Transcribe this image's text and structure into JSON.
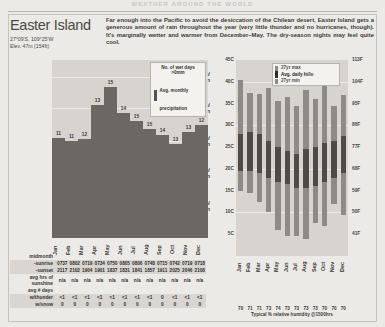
{
  "running_head": "WEATHER AROUND THE WORLD",
  "location": {
    "name": "Easter Island",
    "coordinates": "27°09'S, 109°25'W",
    "elevation": "Elev. 47m (154ft)",
    "description": "Far enough into the Pacific to avoid the desiccation of the Chilean desert, Easter Island gets a generous amount of rain throughout the year (very little thunder and no hurricanes, though). It's marginally wetter and warmer from December–May. The dry-season nights may feel quite cool."
  },
  "months": [
    "Jan",
    "Feb",
    "Mar",
    "Apr",
    "May",
    "Jun",
    "Jul",
    "Aug",
    "Sep",
    "Oct",
    "Nov",
    "Dec"
  ],
  "chart_data": [
    {
      "type": "bar",
      "title": "Avg. monthly precipitation",
      "categories": [
        "Jan",
        "Feb",
        "Mar",
        "Apr",
        "May",
        "Jun",
        "Jul",
        "Aug",
        "Sep",
        "Oct",
        "Nov",
        "Dec"
      ],
      "values": [
        79,
        76,
        78,
        105,
        119,
        98,
        92,
        86,
        81,
        74,
        83,
        89
      ],
      "data_labels": [
        11,
        11,
        12,
        13,
        15,
        14,
        15,
        15,
        14,
        13,
        13,
        12
      ],
      "ylabel": "precipitation",
      "ylim": [
        0,
        140
      ],
      "yticks_mm": [
        25,
        51,
        76,
        102,
        127
      ],
      "ytick_labels": [
        "25mm/\n1in",
        "51mm/\n2in",
        "76mm/\n3in",
        "102mm/\n4in",
        "127mm/\n5in"
      ],
      "ytick_labels_flat": [
        "127mm/ 5in",
        "102mm/ 4in",
        "76mm/ 3in",
        "51mm/ 2in",
        "25mm/ 1in"
      ],
      "legend": {
        "title": "No. of wet days >0mm",
        "title_line1": "No. of wet days",
        "title_line2": ">0mm",
        "swatch_label": "Avg. monthly precipitation",
        "swatch_line1": "Avg. monthly",
        "swatch_line2": "precipitation",
        "swatch_color": "#56534f"
      },
      "grid": true,
      "bar_color": "#6b6863"
    },
    {
      "type": "bar",
      "title": "Temperature range",
      "categories": [
        "Jan",
        "Feb",
        "Mar",
        "Apr",
        "May",
        "Jun",
        "Jul",
        "Aug",
        "Sep",
        "Oct",
        "Nov",
        "Dec"
      ],
      "series": [
        {
          "name": "27yr max",
          "values": [
            40.5,
            37.5,
            37.3,
            38.5,
            35.5,
            36.5,
            34.5,
            38.0,
            36.0,
            39.5,
            34.5,
            37.0
          ]
        },
        {
          "name": "Avg. daily hi",
          "values": [
            28.0,
            28.5,
            28.0,
            26.5,
            25.0,
            24.0,
            23.5,
            24.5,
            25.0,
            26.0,
            26.5,
            27.5
          ]
        },
        {
          "name": "Avg. daily lo",
          "values": [
            19.5,
            19.5,
            19.0,
            18.0,
            17.0,
            16.5,
            15.5,
            15.5,
            16.0,
            17.0,
            18.0,
            19.0
          ]
        },
        {
          "name": "27yr min",
          "values": [
            15.0,
            14.5,
            12.5,
            10.0,
            6.0,
            4.5,
            4.5,
            4.0,
            7.5,
            7.0,
            12.0,
            9.5
          ]
        }
      ],
      "ylabel_left": "°C",
      "ylabel_right": "°F",
      "yticks_c": [
        5,
        10,
        15,
        20,
        25,
        30,
        35,
        40,
        45
      ],
      "ytick_labels_c": [
        "5C",
        "10C",
        "15C",
        "20C",
        "25C",
        "30C",
        "35C",
        "40C",
        "45C"
      ],
      "yticks_f": [
        41,
        50,
        59,
        68,
        77,
        86,
        95,
        104,
        113
      ],
      "ytick_labels_f": [
        "41F",
        "50F",
        "59F",
        "68F",
        "77F",
        "86F",
        "95F",
        "104F",
        "113F"
      ],
      "ylim_c": [
        0,
        45
      ],
      "legend": {
        "top_label": "27yr max",
        "mid_label": "Avg. daily hi/lo",
        "bottom_label": "27yr min",
        "range_color": "#8e8b86",
        "avg_color": "#4e4b47"
      },
      "grid": true
    }
  ],
  "humidity": {
    "values": [
      "70",
      "71",
      "71",
      "73",
      "74",
      "73",
      "73",
      "73",
      "73",
      "70",
      "70",
      "70"
    ],
    "caption": "Typical % relative humidity @1500hrs"
  },
  "table": {
    "midmonth_label": "midmonth",
    "rows": [
      {
        "label": "-sunrise",
        "shaded": true,
        "values": [
          "0737",
          "0802",
          "0719",
          "0734",
          "0750",
          "0805",
          "0806",
          "0748",
          "0715",
          "0742",
          "0719",
          "0718"
        ]
      },
      {
        "label": "-sunset",
        "shaded": true,
        "values": [
          "2117",
          "2102",
          "1904",
          "1901",
          "1837",
          "1831",
          "1841",
          "1857",
          "1911",
          "2025",
          "2046",
          "2108"
        ]
      }
    ],
    "sunshine_label_line1": "avg hrs of",
    "sunshine_label_line2": "sunshine",
    "sunshine_values": [
      "n/a",
      "n/a",
      "n/a",
      "n/a",
      "n/a",
      "n/a",
      "n/a",
      "n/a",
      "n/a",
      "n/a",
      "n/a",
      "n/a"
    ],
    "days_label_line1": "avg # days",
    "thunder_label": "w/thunder",
    "thunder_values": [
      "<1",
      "<1",
      "<1",
      "<1",
      "<1",
      "<1",
      "<1",
      "<1",
      "0",
      "<1",
      "<1",
      "<1"
    ],
    "snow_label": "w/snow",
    "snow_values": [
      "0",
      "0",
      "0",
      "0",
      "0",
      "0",
      "0",
      "0",
      "0",
      "0",
      "0",
      "0"
    ]
  }
}
